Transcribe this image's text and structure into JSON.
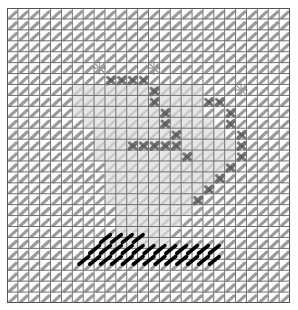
{
  "pattern": {
    "cols": 26,
    "rows": 27,
    "colors": {
      "background": "#ffffff",
      "grid_line": "#6e6e6e",
      "grid_border": "#555555",
      "base_stitch": "#8a8a8a",
      "light_region_stitch": "#c4c4c4",
      "light_region_fill": "#e6e6e6",
      "dark_stitch": "#5a5a5a",
      "black_stitch": "#000000"
    },
    "light_region": [
      [
        7,
        6,
        16
      ],
      [
        7,
        7,
        17
      ],
      [
        8,
        6,
        17
      ],
      [
        9,
        6,
        17
      ],
      [
        10,
        7,
        18
      ],
      [
        11,
        8,
        19
      ],
      [
        12,
        8,
        20
      ],
      [
        13,
        8,
        20
      ],
      [
        14,
        9,
        20
      ],
      [
        15,
        9,
        19
      ],
      [
        16,
        9,
        18
      ],
      [
        17,
        9,
        17
      ],
      [
        18,
        10,
        16
      ],
      [
        19,
        10,
        15
      ],
      [
        20,
        10,
        14
      ],
      [
        21,
        9,
        14
      ]
    ],
    "dark_cells": [
      [
        6,
        9
      ],
      [
        6,
        10
      ],
      [
        6,
        11
      ],
      [
        6,
        12
      ],
      [
        7,
        13
      ],
      [
        8,
        13
      ],
      [
        8,
        18
      ],
      [
        8,
        19
      ],
      [
        9,
        14
      ],
      [
        9,
        20
      ],
      [
        10,
        14
      ],
      [
        10,
        20
      ],
      [
        11,
        15
      ],
      [
        11,
        21
      ],
      [
        12,
        11
      ],
      [
        12,
        12
      ],
      [
        12,
        13
      ],
      [
        12,
        14
      ],
      [
        12,
        15
      ],
      [
        12,
        21
      ],
      [
        13,
        16
      ],
      [
        13,
        21
      ],
      [
        14,
        20
      ],
      [
        15,
        19
      ],
      [
        16,
        18
      ],
      [
        17,
        17
      ]
    ],
    "stars": [
      [
        5,
        8
      ],
      [
        5,
        13
      ],
      [
        7,
        21
      ]
    ],
    "black_stitches": [
      {
        "row": 20.7,
        "start": 8.6,
        "count": 4
      },
      {
        "row": 21.7,
        "start": 7.6,
        "count": 12
      },
      {
        "row": 22.7,
        "start": 6.6,
        "count": 13
      }
    ]
  }
}
